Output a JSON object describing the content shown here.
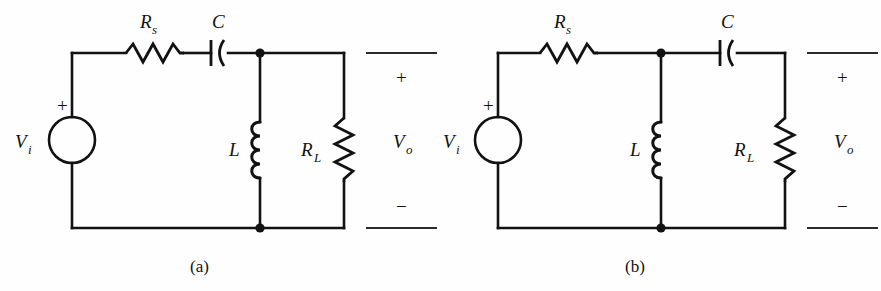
{
  "figure": {
    "background_color": "#fefefe",
    "ink_color": "#121212",
    "panels": [
      {
        "caption": "(a)",
        "topology": "series R-C feeding parallel L and R_L (high-pass-to-tank)",
        "source": {
          "label": "V",
          "subscript": "i",
          "polarity_sign": "+",
          "symbol": "circle-source"
        },
        "components": [
          {
            "id": "Rs",
            "label": "R",
            "subscript": "s",
            "symbol": "resistor-zigzag",
            "orientation": "horizontal",
            "branch": "top-series"
          },
          {
            "id": "C",
            "label": "C",
            "subscript": "",
            "symbol": "capacitor-curved-plate",
            "orientation": "horizontal",
            "branch": "top-series"
          },
          {
            "id": "L",
            "label": "L",
            "subscript": "",
            "symbol": "inductor-coil",
            "orientation": "vertical",
            "branch": "shunt-left"
          },
          {
            "id": "RL",
            "label": "R",
            "subscript": "L",
            "symbol": "resistor-zigzag",
            "orientation": "vertical",
            "branch": "shunt-right"
          }
        ],
        "output": {
          "label": "V",
          "subscript": "o",
          "plus_sign": "+",
          "minus_sign": "−"
        }
      },
      {
        "caption": "(b)",
        "topology": "series R_s, shunt L, series C feeding R_L",
        "source": {
          "label": "V",
          "subscript": "i",
          "polarity_sign": "+",
          "symbol": "circle-source"
        },
        "components": [
          {
            "id": "Rs",
            "label": "R",
            "subscript": "s",
            "symbol": "resistor-zigzag",
            "orientation": "horizontal",
            "branch": "top-series-left"
          },
          {
            "id": "C",
            "label": "C",
            "subscript": "",
            "symbol": "capacitor-curved-plate",
            "orientation": "horizontal",
            "branch": "top-series-right"
          },
          {
            "id": "L",
            "label": "L",
            "subscript": "",
            "symbol": "inductor-coil",
            "orientation": "vertical",
            "branch": "shunt-middle"
          },
          {
            "id": "RL",
            "label": "R",
            "subscript": "L",
            "symbol": "resistor-zigzag",
            "orientation": "vertical",
            "branch": "shunt-right"
          }
        ],
        "output": {
          "label": "V",
          "subscript": "o",
          "plus_sign": "+",
          "minus_sign": "−"
        }
      }
    ]
  }
}
